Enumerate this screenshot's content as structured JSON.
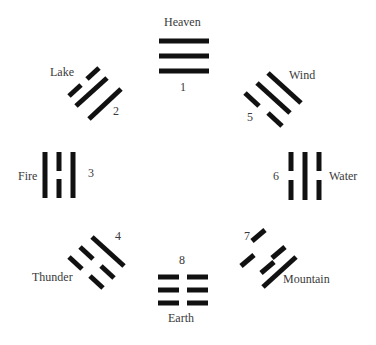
{
  "diagram": {
    "type": "bagua-trigram-circle",
    "stroke_color": "#111111",
    "text_color": "#3a3a3a",
    "trigrams": [
      {
        "number": "1",
        "name": "Heaven",
        "lines_outer_to_inner": [
          "solid",
          "solid",
          "solid"
        ]
      },
      {
        "number": "2",
        "name": "Lake",
        "lines_outer_to_inner": [
          "broken",
          "solid",
          "solid"
        ]
      },
      {
        "number": "3",
        "name": "Fire",
        "lines_outer_to_inner": [
          "solid",
          "broken",
          "solid"
        ]
      },
      {
        "number": "4",
        "name": "Thunder",
        "lines_outer_to_inner": [
          "broken",
          "broken",
          "solid"
        ]
      },
      {
        "number": "5",
        "name": "Wind",
        "lines_outer_to_inner": [
          "solid",
          "solid",
          "broken"
        ]
      },
      {
        "number": "6",
        "name": "Water",
        "lines_outer_to_inner": [
          "broken",
          "solid",
          "broken"
        ]
      },
      {
        "number": "7",
        "name": "Mountain",
        "lines_outer_to_inner": [
          "solid",
          "broken",
          "broken"
        ]
      },
      {
        "number": "8",
        "name": "Earth",
        "lines_outer_to_inner": [
          "broken",
          "broken",
          "broken"
        ]
      }
    ]
  }
}
